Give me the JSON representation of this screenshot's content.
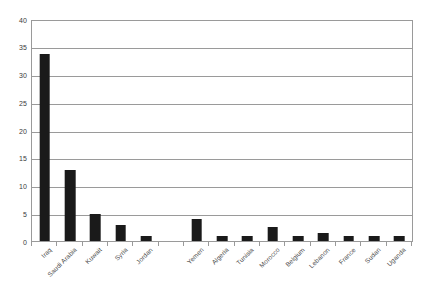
{
  "chart_data": {
    "type": "bar",
    "title": "",
    "subtitle": "",
    "xlabel": "",
    "ylabel": "",
    "ylim": [
      0,
      40
    ],
    "yticks": [
      0,
      5,
      10,
      15,
      20,
      25,
      30,
      35,
      40
    ],
    "grid": true,
    "legend": false,
    "legend_position": "none",
    "bar_color": "#1a1a1a",
    "grid_color": "#9a9a9a",
    "background_color": "#ffffff",
    "axis_label_color": "#4a4a4a",
    "categories": [
      "Iraq",
      "Saudi Arabia",
      "Kuwait",
      "Syria",
      "Jordan",
      "",
      "Yemen",
      "Algeria",
      "Tunisia",
      "Morocco",
      "Belgium",
      "Lebanon",
      "France",
      "Sudan",
      "Uganda"
    ],
    "values": [
      34,
      13,
      5,
      3,
      1,
      0,
      4,
      1,
      1,
      2.5,
      1,
      1.5,
      1,
      1,
      1
    ]
  }
}
